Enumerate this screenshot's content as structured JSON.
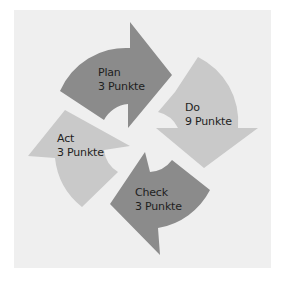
{
  "diagram": {
    "type": "cycle",
    "colors": {
      "background": "#efefef",
      "dark": "#8b8b8b",
      "light": "#c9c9c9",
      "text": "#1e1e1e"
    },
    "steps": [
      {
        "name": "Plan",
        "score": "3 Punkte",
        "shade": "dark"
      },
      {
        "name": "Do",
        "score": "9 Punkte",
        "shade": "light"
      },
      {
        "name": "Check",
        "score": "3 Punkte",
        "shade": "dark"
      },
      {
        "name": "Act",
        "score": "3 Punkte",
        "shade": "light"
      }
    ]
  }
}
